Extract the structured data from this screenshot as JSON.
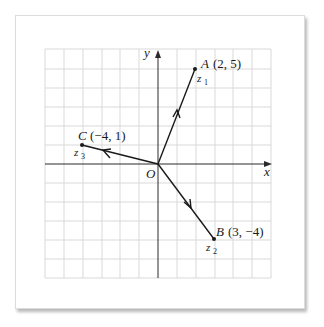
{
  "diagram": {
    "title": "",
    "axes": {
      "x_label": "x",
      "y_label": "y",
      "origin_label": "O"
    },
    "grid": {
      "x_range": [
        -6,
        6
      ],
      "y_range": [
        -6,
        6
      ],
      "cell_px": 19,
      "color": "#d6d6d6"
    },
    "points": [
      {
        "name": "A",
        "coords_text": "(2, 5)",
        "x": 2,
        "y": 5,
        "complex_label": "z",
        "subscript": "1"
      },
      {
        "name": "B",
        "coords_text": "(3, −4)",
        "x": 3,
        "y": -4,
        "complex_label": "z",
        "subscript": "2"
      },
      {
        "name": "C",
        "coords_text": "(−4, 1)",
        "x": -4,
        "y": 1,
        "complex_label": "z",
        "subscript": "3"
      }
    ],
    "vectors": [
      {
        "from": "O",
        "to": "A",
        "arrow": "midpoint"
      },
      {
        "from": "O",
        "to": "B",
        "arrow": "midpoint"
      },
      {
        "from": "O",
        "to": "C",
        "arrow": "midpoint"
      }
    ],
    "line_color": "#1a1a1a"
  }
}
